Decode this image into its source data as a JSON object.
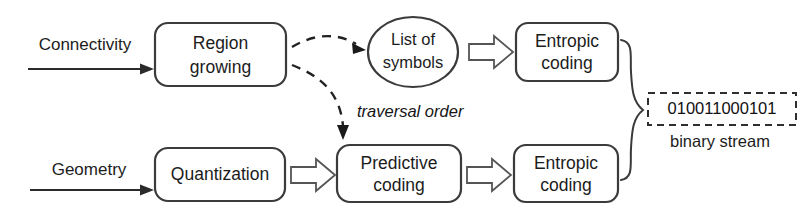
{
  "diagram": {
    "colors": {
      "stroke": "#3b3b3b",
      "text": "#1c1c1c",
      "background": "#ffffff",
      "block_arrow_stroke": "#555555"
    },
    "inputs": [
      {
        "id": "connectivity",
        "label": "Connectivity"
      },
      {
        "id": "geometry",
        "label": "Geometry"
      }
    ],
    "nodes": [
      {
        "id": "region-growing",
        "shape": "rounded-rect",
        "line1": "Region",
        "line2": "growing"
      },
      {
        "id": "list-of-symbols",
        "shape": "ellipse",
        "line1": "List of",
        "line2": "symbols"
      },
      {
        "id": "entropic-coding-top",
        "shape": "rounded-rect",
        "line1": "Entropic",
        "line2": "coding"
      },
      {
        "id": "quantization",
        "shape": "rounded-rect",
        "line1": "Quantization",
        "line2": ""
      },
      {
        "id": "predictive-coding",
        "shape": "rounded-rect",
        "line1": "Predictive",
        "line2": "coding"
      },
      {
        "id": "entropic-coding-bottom",
        "shape": "rounded-rect",
        "line1": "Entropic",
        "line2": "coding"
      }
    ],
    "edges": [
      {
        "id": "edge-traversal-order",
        "label": "traversal order",
        "style": "dashed"
      }
    ],
    "output": {
      "bits": "010011000101",
      "caption": "binary stream"
    }
  }
}
